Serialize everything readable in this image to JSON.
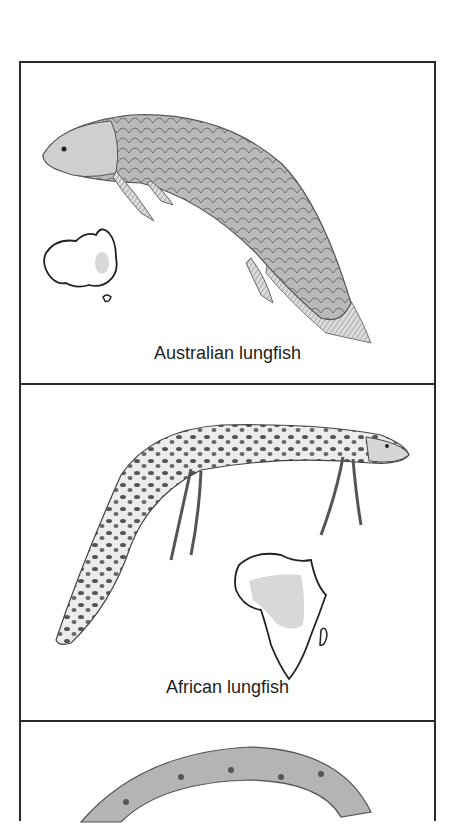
{
  "figure": {
    "panels": [
      {
        "caption": "Australian lungfish",
        "map": "australia-map",
        "range_highlight": "eastern Queensland"
      },
      {
        "caption": "African lungfish",
        "map": "africa-map",
        "range_highlight": "central Africa"
      },
      {
        "caption": "",
        "map": null
      }
    ],
    "colors": {
      "border": "#2a2a2a",
      "fish_shade": "#9a9a9a",
      "range_fill": "#d8d8d8",
      "text": "#1e1e1e"
    }
  }
}
